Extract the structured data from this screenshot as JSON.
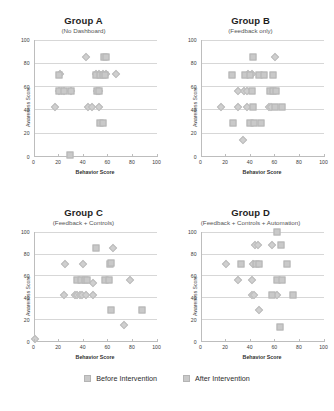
{
  "legend": {
    "before": {
      "label": "Before Intervention",
      "marker": "diamond-marker",
      "color": "#cfcfcf"
    },
    "after": {
      "label": "After Intervention",
      "marker": "square-marker",
      "color": "#c9c9c9"
    }
  },
  "caption": {
    "text": ""
  },
  "axes": {
    "xlabel": "Behavior Score",
    "ylabel": "Awareness Score",
    "xticks": [
      0,
      20,
      40,
      60,
      80,
      100
    ],
    "yticks": [
      0,
      20,
      40,
      60,
      80,
      100
    ]
  },
  "panels": [
    {
      "title": "Group A",
      "subtitle": "(No Dashboard)"
    },
    {
      "title": "Group B",
      "subtitle": "(Feedback only)"
    },
    {
      "title": "Group C",
      "subtitle": "(Feedback + Controls)"
    },
    {
      "title": "Group D",
      "subtitle": "(Feedback + Controls + Automation)"
    }
  ],
  "chart_data": [
    {
      "type": "scatter",
      "title": "Group A",
      "subtitle": "(No Dashboard)",
      "xlabel": "Behavior Score",
      "ylabel": "Awareness Score",
      "xlim": [
        0,
        100
      ],
      "ylim": [
        0,
        100
      ],
      "grid": true,
      "legend_position": "bottom",
      "series": [
        {
          "name": "Before Intervention",
          "marker": "diamond",
          "points": [
            [
              17,
              42
            ],
            [
              42,
              85
            ],
            [
              50,
              70
            ],
            [
              53,
              70
            ],
            [
              56,
              70
            ],
            [
              59,
              70
            ],
            [
              67,
              70
            ],
            [
              44,
              42
            ],
            [
              47,
              42
            ],
            [
              53,
              42
            ],
            [
              51,
              56
            ],
            [
              53,
              56
            ],
            [
              21,
              70
            ],
            [
              20,
              56
            ],
            [
              24,
              56
            ],
            [
              30,
              56
            ]
          ]
        },
        {
          "name": "After Intervention",
          "marker": "square",
          "points": [
            [
              57,
              85
            ],
            [
              59,
              85
            ],
            [
              50,
              70
            ],
            [
              54,
              70
            ],
            [
              56,
              70
            ],
            [
              58,
              70
            ],
            [
              20,
              70
            ],
            [
              20,
              56
            ],
            [
              24,
              56
            ],
            [
              30,
              56
            ],
            [
              51,
              56
            ],
            [
              53,
              56
            ],
            [
              54,
              28
            ],
            [
              56,
              28
            ],
            [
              29,
              1
            ]
          ]
        }
      ]
    },
    {
      "type": "scatter",
      "title": "Group B",
      "subtitle": "(Feedback only)",
      "xlabel": "Behavior Score",
      "ylabel": "Awareness Score",
      "xlim": [
        0,
        100
      ],
      "ylim": [
        0,
        100
      ],
      "grid": true,
      "legend_position": "bottom",
      "series": [
        {
          "name": "Before Intervention",
          "marker": "diamond",
          "points": [
            [
              60,
              85
            ],
            [
              38,
              70
            ],
            [
              41,
              70
            ],
            [
              30,
              56
            ],
            [
              35,
              56
            ],
            [
              37,
              56
            ],
            [
              16,
              42
            ],
            [
              30,
              42
            ],
            [
              37,
              42
            ],
            [
              55,
              42
            ],
            [
              57,
              42
            ],
            [
              34,
              13
            ]
          ]
        },
        {
          "name": "After Intervention",
          "marker": "square",
          "points": [
            [
              42,
              85
            ],
            [
              25,
              70
            ],
            [
              36,
              70
            ],
            [
              40,
              70
            ],
            [
              47,
              70
            ],
            [
              51,
              70
            ],
            [
              59,
              70
            ],
            [
              41,
              56
            ],
            [
              56,
              56
            ],
            [
              59,
              56
            ],
            [
              61,
              56
            ],
            [
              42,
              42
            ],
            [
              60,
              42
            ],
            [
              66,
              42
            ],
            [
              26,
              28
            ],
            [
              40,
              28
            ],
            [
              43,
              28
            ],
            [
              49,
              28
            ]
          ]
        }
      ]
    },
    {
      "type": "scatter",
      "title": "Group C",
      "subtitle": "(Feedback + Controls)",
      "xlabel": "Behavior Score",
      "ylabel": "Awareness Score",
      "xlim": [
        0,
        100
      ],
      "ylim": [
        0,
        100
      ],
      "grid": true,
      "legend_position": "bottom",
      "series": [
        {
          "name": "Before Intervention",
          "marker": "diamond",
          "points": [
            [
              64,
              85
            ],
            [
              25,
              70
            ],
            [
              40,
              70
            ],
            [
              48,
              53
            ],
            [
              78,
              56
            ],
            [
              24,
              42
            ],
            [
              33,
              42
            ],
            [
              35,
              42
            ],
            [
              37,
              42
            ],
            [
              39,
              42
            ],
            [
              42,
              42
            ],
            [
              48,
              42
            ],
            [
              73,
              14
            ],
            [
              0,
              1
            ]
          ]
        },
        {
          "name": "After Intervention",
          "marker": "square",
          "points": [
            [
              50,
              85
            ],
            [
              62,
              70
            ],
            [
              63,
              71
            ],
            [
              35,
              56
            ],
            [
              38,
              56
            ],
            [
              41,
              56
            ],
            [
              43,
              56
            ],
            [
              58,
              56
            ],
            [
              61,
              56
            ],
            [
              63,
              28
            ],
            [
              88,
              28
            ]
          ]
        }
      ]
    },
    {
      "type": "scatter",
      "title": "Group D",
      "subtitle": "(Feedback + Controls + Automation)",
      "xlabel": "Behavior Score",
      "ylabel": "Awareness Score",
      "xlim": [
        0,
        100
      ],
      "ylim": [
        0,
        100
      ],
      "grid": true,
      "legend_position": "bottom",
      "series": [
        {
          "name": "Before Intervention",
          "marker": "diamond",
          "points": [
            [
              44,
              88
            ],
            [
              46,
              88
            ],
            [
              58,
              88
            ],
            [
              20,
              70
            ],
            [
              42,
              70
            ],
            [
              30,
              56
            ],
            [
              41,
              56
            ],
            [
              41,
              42
            ],
            [
              43,
              42
            ],
            [
              62,
              42
            ],
            [
              47,
              28
            ]
          ]
        },
        {
          "name": "After Intervention",
          "marker": "square",
          "points": [
            [
              62,
              100
            ],
            [
              65,
              88
            ],
            [
              32,
              70
            ],
            [
              45,
              70
            ],
            [
              47,
              70
            ],
            [
              70,
              70
            ],
            [
              62,
              56
            ],
            [
              66,
              56
            ],
            [
              58,
              42
            ],
            [
              75,
              42
            ],
            [
              64,
              13
            ]
          ]
        }
      ]
    }
  ]
}
